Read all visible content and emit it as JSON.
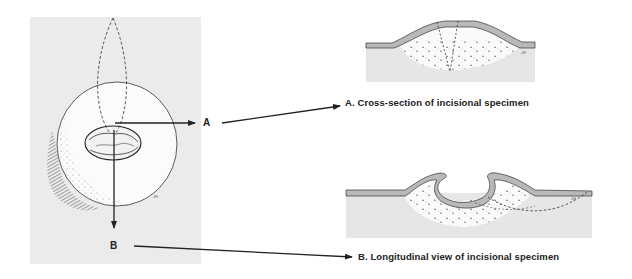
{
  "figure": {
    "left_panel": {
      "description": "Top view of lesion with elliptical incision outline",
      "background": "#ebebeb",
      "label_a": "A",
      "label_b": "B",
      "signature": "JH"
    },
    "panel_a": {
      "caption": "A. Cross-section of incisional specimen",
      "signature": "JH"
    },
    "panel_b": {
      "caption": "B. Longitudinal view of incisional specimen",
      "signature": "JH"
    },
    "colors": {
      "panel_gray": "#ebebeb",
      "skin_band": "#b9b9b9",
      "line": "#222222",
      "lesion_fill": "#fafafa"
    }
  }
}
